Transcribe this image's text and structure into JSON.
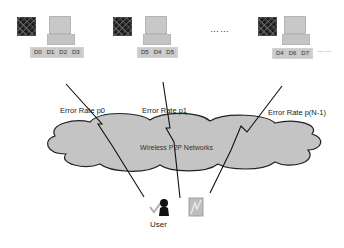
{
  "nodes": [
    {
      "chips": [
        "D0",
        "D1",
        "D2",
        "D3"
      ]
    },
    {
      "chips": [
        "D5",
        "D4",
        "D5"
      ]
    },
    {
      "chips": [
        "D4",
        "D6",
        "D7"
      ]
    }
  ],
  "ellipsis_middle": "……",
  "ellipsis_right": "……",
  "links": [
    {
      "label": "Error Rate p0"
    },
    {
      "label": "Error Rate p1"
    },
    {
      "label": "Error Rate p(N-1)"
    }
  ],
  "cloud": {
    "label": "Wireless P2P Networks",
    "fill": "#c4c4c4",
    "stroke": "#222222"
  },
  "user": {
    "label": "User"
  }
}
